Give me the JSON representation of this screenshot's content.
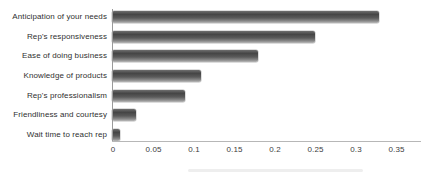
{
  "chart_data": {
    "type": "bar",
    "orientation": "horizontal",
    "title": "",
    "categories": [
      "Anticipation of your needs",
      "Rep's responsiveness",
      "Ease of doing business",
      "Knowledge of products",
      "Rep's professionalism",
      "Friendliness and courtesy",
      "Wait time to reach rep"
    ],
    "values": [
      0.33,
      0.25,
      0.18,
      0.11,
      0.09,
      0.03,
      0.01
    ],
    "x_tick_labels": [
      "0",
      "0.05",
      "0.1",
      "0.15",
      "0.2",
      "0.25",
      "0.3",
      "0.35"
    ],
    "x_tick_values": [
      0,
      0.05,
      0.1,
      0.15,
      0.2,
      0.25,
      0.3,
      0.35
    ],
    "xlim": [
      0,
      0.35
    ],
    "grid": "off",
    "legend": "none",
    "colors": {
      "bar_gloss_top": "#6e6e6e",
      "bar_dark": "#454545",
      "bar_mid": "#5a5a5a",
      "bar_gloss_bottom": "#b9b9b9",
      "axis_line": "#b7b7b7",
      "y_axis_line": "#9a9a9a",
      "label_text": "#2f2f2f",
      "tick_text": "#3c3c3c",
      "background": "#ffffff"
    }
  }
}
